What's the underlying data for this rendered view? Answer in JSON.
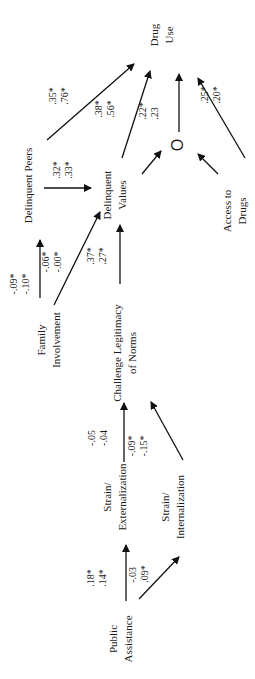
{
  "diagram": {
    "type": "path-diagram",
    "orientation": "rotated-90-ccw",
    "nodes": {
      "drug_use": [
        "Drug",
        "Use"
      ],
      "delinquent_peers": "Delinquent Peers",
      "delinquent_values": [
        "Delinquent",
        "Values"
      ],
      "mediator": "O",
      "access_to_drugs": [
        "Access to",
        "Drugs"
      ],
      "family_involvement": [
        "Family",
        "Involvement"
      ],
      "challenge_legitimacy": [
        "Challenge Legitimacy",
        "of Norms"
      ],
      "strain_externalization": [
        "Strain/",
        "Externalization"
      ],
      "strain_internalization": [
        "Strain/",
        "Internalization"
      ],
      "public_assistance": [
        "Public",
        "Assistance"
      ]
    },
    "edges": {
      "peers_to_druguse": [
        ".35*",
        ".76*"
      ],
      "peers_to_values": [
        ".32*",
        ".33*"
      ],
      "values_to_druguse_a": [
        ".38*",
        ".56*"
      ],
      "values_to_druguse_b": [
        ".22*",
        ".23"
      ],
      "access_to_druguse": [
        ".25*",
        ".20*"
      ],
      "family_top": [
        "-.09*",
        "-.10*"
      ],
      "family_to_peers": [
        "-.06*",
        "-.00*"
      ],
      "challenge_to_values": [
        ".37*",
        ".27*"
      ],
      "strain_ext_to_challenge": [
        "-.05",
        "-.04"
      ],
      "strain_int_to_challenge": [
        "-.09*",
        "-.15*"
      ],
      "public_to_ext": [
        ".18*",
        ".14*"
      ],
      "public_to_int": [
        "-.03",
        ".09*"
      ]
    }
  }
}
